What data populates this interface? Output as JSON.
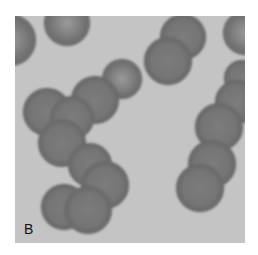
{
  "figure": {
    "panel_label": "B",
    "colors": {
      "background": "#c4c4c4",
      "cell_rim": "#6a6a6a",
      "cell_body": "#7a7a7a",
      "cell_center": "#8c8c8c",
      "label": "#111111"
    },
    "cells": [
      {
        "cx": -5,
        "cy": 24,
        "r": 26,
        "pale_center": true
      },
      {
        "cx": 52,
        "cy": 7,
        "r": 23,
        "pale_center": true
      },
      {
        "cx": 168,
        "cy": 21,
        "r": 23,
        "pale_center": false
      },
      {
        "cx": 153,
        "cy": 45,
        "r": 24,
        "pale_center": false
      },
      {
        "cx": 230,
        "cy": 17,
        "r": 22,
        "pale_center": true
      },
      {
        "cx": 227,
        "cy": 62,
        "r": 18,
        "pale_center": false
      },
      {
        "cx": 222,
        "cy": 86,
        "r": 22,
        "pale_center": false
      },
      {
        "cx": 107,
        "cy": 63,
        "r": 20,
        "pale_center": true
      },
      {
        "cx": 80,
        "cy": 84,
        "r": 24,
        "pale_center": false
      },
      {
        "cx": 32,
        "cy": 96,
        "r": 24,
        "pale_center": false
      },
      {
        "cx": 57,
        "cy": 102,
        "r": 22,
        "pale_center": false
      },
      {
        "cx": 47,
        "cy": 127,
        "r": 24,
        "pale_center": false
      },
      {
        "cx": 204,
        "cy": 111,
        "r": 24,
        "pale_center": false
      },
      {
        "cx": 197,
        "cy": 148,
        "r": 24,
        "pale_center": false
      },
      {
        "cx": 185,
        "cy": 172,
        "r": 24,
        "pale_center": false
      },
      {
        "cx": 75,
        "cy": 149,
        "r": 22,
        "pale_center": false
      },
      {
        "cx": 90,
        "cy": 169,
        "r": 24,
        "pale_center": false
      },
      {
        "cx": 49,
        "cy": 191,
        "r": 23,
        "pale_center": false
      },
      {
        "cx": 73,
        "cy": 194,
        "r": 24,
        "pale_center": false
      }
    ]
  }
}
